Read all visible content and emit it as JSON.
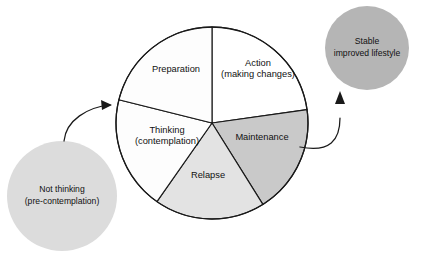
{
  "diagram": {
    "canvas": {
      "width": 430,
      "height": 253,
      "background": "#ffffff"
    },
    "wheel": {
      "name": "cycle-of-change-wheel",
      "center_x": 212,
      "center_y": 123,
      "radius": 96,
      "outline_color": "#1a1a1a"
    },
    "segments": [
      {
        "id": "action",
        "label_line1": "Action",
        "label_line2": "(making changes)",
        "fill": "#ffffff",
        "start_angle": -90,
        "end_angle": -8,
        "label_x": 258,
        "label_y": 69
      },
      {
        "id": "maintenance",
        "label_line1": "Maintenance",
        "label_line2": "",
        "fill": "#c9c9c9",
        "start_angle": -8,
        "end_angle": 58,
        "label_x": 262,
        "label_y": 138
      },
      {
        "id": "relapse",
        "label_line1": "Relapse",
        "label_line2": "",
        "fill": "#e3e3e3",
        "start_angle": 58,
        "end_angle": 125,
        "label_x": 208,
        "label_y": 176
      },
      {
        "id": "thinking",
        "label_line1": "Thinking",
        "label_line2": "(contemplation)",
        "fill": "#fdfdfd",
        "start_angle": 125,
        "end_angle": 194,
        "label_x": 167,
        "label_y": 136
      },
      {
        "id": "preparation",
        "label_line1": "Preparation",
        "label_line2": "",
        "fill": "#fdfdfd",
        "start_angle": 194,
        "end_angle": 270,
        "label_x": 176,
        "label_y": 70
      }
    ],
    "side_nodes": [
      {
        "id": "not-thinking",
        "label_line1": "Not thinking",
        "label_line2": "(pre-contemplation)",
        "fill": "#dcdcdc",
        "center_x": 62,
        "center_y": 196,
        "radius": 55,
        "label_x": 62,
        "label_y": 196
      },
      {
        "id": "stable-lifestyle",
        "label_line1": "Stable",
        "label_line2": "improved lifestyle",
        "fill": "#b5b5b5",
        "center_x": 367,
        "center_y": 48,
        "radius": 42,
        "label_x": 367,
        "label_y": 48
      }
    ],
    "arrows": [
      {
        "id": "entry-arrow",
        "from": "not-thinking",
        "to": "thinking",
        "path": "M 64 141 C 66 120 88 107 110 105",
        "head": "112 105 101 100 102 110"
      },
      {
        "id": "exit-arrow",
        "from": "maintenance",
        "to": "stable-lifestyle",
        "path": "M 300 147 C 330 153 340 140 340 118",
        "head": "340 91 335 104 345 104"
      }
    ]
  }
}
